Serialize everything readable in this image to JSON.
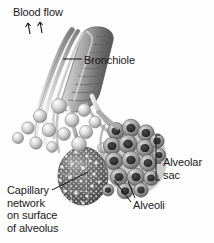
{
  "figure": {
    "background_color": "#fdfdfd",
    "width": 214,
    "height": 243
  },
  "labels": {
    "blood_flow": "Blood flow",
    "bronchiole": "Bronchiole",
    "alveolar_sac": "Alveolar\nsac",
    "alveoli": "Alveoli",
    "capillary_network": "Capillary\nnetwork\non surface\nof alveolus"
  },
  "colors": {
    "text": "#1b1b1b",
    "leader_line": "#1a1a1a",
    "tissue_light": "#e8e8e8",
    "tissue_mid": "#b6b6b6",
    "tissue_dark": "#6e6e6e",
    "tissue_deep": "#3d3d3d",
    "alveolus_highlight": "#f2f2f2",
    "capillary_blob": "#5f5f5f"
  },
  "structures": {
    "bronchiole_tube": "ribbed cartilage tube running diagonally from upper right to lower left",
    "alveolar_sac_cluster": "grape-like cluster of alveoli at lower right",
    "capillary_alveolus": "stippled dark sphere representing capillary network on an alveolus",
    "blood_flow_arrows": 2
  }
}
